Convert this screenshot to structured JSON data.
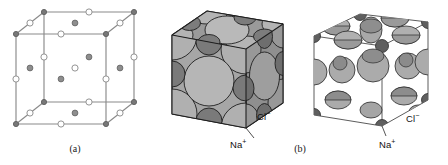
{
  "figure": {
    "background_color": "#ffffff"
  },
  "panels": [
    {
      "id": "a",
      "caption": "(a)",
      "type": "ball-and-stick-unit-cell",
      "description": "Expanded ball-and-stick representation of the NaCl face-centered cubic unit cell",
      "edge_color": "#8a8a8a",
      "vertex_color": "#7a7a7a",
      "anion_fill": "#ffffff",
      "anion_stroke": "#909090",
      "cation_fill": "#8e8e8e",
      "cation_stroke": "#6d6d6d"
    },
    {
      "id": "b1",
      "caption": "",
      "type": "space-filling-full",
      "description": "Space-filling model of NaCl showing ions at full ionic radii filling the cube",
      "cl_label": "Cl",
      "cl_charge": "−",
      "na_label": "Na",
      "na_charge": "+",
      "chloride_color": "#a8a8a8",
      "sodium_color": "#777777",
      "outline_color": "#1f1f1f"
    },
    {
      "id": "b2",
      "caption": "(b)",
      "type": "space-filling-reduced",
      "description": "Reduced-radius space-filling model of NaCl revealing the face-centered cubic arrangement",
      "cl_label": "Cl",
      "cl_charge": "−",
      "na_label": "Na",
      "na_charge": "+",
      "chloride_color": "#b2b2b2",
      "sodium_color": "#6f6f6f",
      "outline_color": "#2a2a2a",
      "edge_color": "#555555"
    }
  ],
  "labels": {
    "caption_a": "(a)",
    "caption_b": "(b)",
    "chloride_1": "Cl",
    "chloride_1_charge": "−",
    "sodium_1": "Na",
    "sodium_1_charge": "+",
    "chloride_2": "Cl",
    "chloride_2_charge": "−",
    "sodium_2": "Na",
    "sodium_2_charge": "+"
  },
  "colors": {
    "background": "#ffffff",
    "line": "#8a8a8a",
    "chloride_light": "#ababab",
    "chloride_mid": "#9c9c9c",
    "sodium_dark": "#6f6f6f",
    "text": "#111111"
  }
}
